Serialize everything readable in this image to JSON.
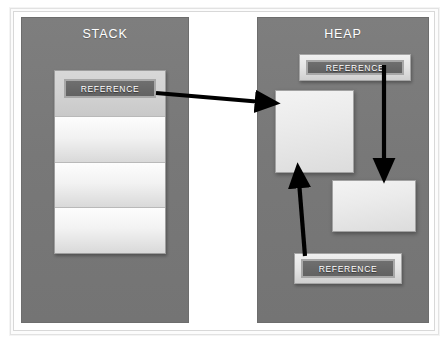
{
  "diagram": {
    "title_stack": "STACK",
    "title_heap": "HEAP",
    "reference_label": "REFERENCE",
    "colors": {
      "region_fill": "#787878",
      "region_border": "#6d6d6d",
      "cell_fill": "#f2f2f2",
      "chip_fill": "#686868",
      "chip_border": "#a8a8a8",
      "arrow": "#000000",
      "page_background": "#ffffff",
      "frame_border": "#d8d8d8",
      "title_text": "#ffffff",
      "chip_text": "#ffffff"
    },
    "regions": [
      {
        "name": "stack",
        "title": "STACK",
        "cells": [
          {
            "label": "REFERENCE",
            "has_reference": true
          },
          {
            "label": "",
            "has_reference": false
          },
          {
            "label": "",
            "has_reference": false
          },
          {
            "label": "",
            "has_reference": false
          }
        ]
      },
      {
        "name": "heap",
        "title": "HEAP",
        "references": [
          {
            "label": "REFERENCE",
            "position": "top"
          },
          {
            "label": "REFERENCE",
            "position": "bottom"
          }
        ],
        "objects": [
          {
            "name": "object-1",
            "label": ""
          },
          {
            "name": "object-2",
            "label": ""
          }
        ]
      }
    ],
    "arrows": [
      {
        "name": "stack-reference-to-heap-object-1",
        "from": "stack.reference",
        "to": "heap.object-1",
        "direction": "right"
      },
      {
        "name": "heap-top-reference-to-heap-object-2",
        "from": "heap.reference.top",
        "to": "heap.object-2",
        "direction": "down"
      },
      {
        "name": "heap-bottom-reference-to-heap-object-1",
        "from": "heap.reference.bottom",
        "to": "heap.object-1",
        "direction": "up"
      }
    ]
  }
}
